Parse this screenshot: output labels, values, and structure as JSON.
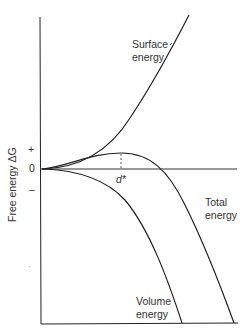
{
  "diagram": {
    "y_axis_label": "Free energy ΔG",
    "ticks": {
      "plus": "+",
      "zero": "0",
      "minus": "–"
    },
    "critical_size_label": "d*",
    "curves": [
      {
        "id": "surface",
        "label_line1": "Surface",
        "label_line2": "energy"
      },
      {
        "id": "total",
        "label_line1": "Total",
        "label_line2": "energy"
      },
      {
        "id": "volume",
        "label_line1": "Volume",
        "label_line2": "energy"
      }
    ],
    "stray_mark": "·",
    "colors": {
      "line": "#222222",
      "text": "#333333",
      "background": "#ffffff"
    }
  }
}
